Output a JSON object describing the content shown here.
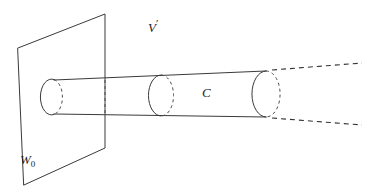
{
  "figure": {
    "kind": "geometric-diagram",
    "caption_labels": {
      "ambient_space": "V",
      "ambient_space_modifier": "′",
      "plane": "W",
      "plane_subscript": "0",
      "cylinder": "C"
    },
    "colors": {
      "background": "#ffffff",
      "visible_stroke": "#3a3a3a",
      "hidden_stroke": "#4a4a4a",
      "extension_stroke": "#333333",
      "text": "#1e1e1e"
    },
    "canvas": {
      "width": 369,
      "height": 195
    },
    "geometry": {
      "plane_polygon": "18,48 105,14 105,148 24,185",
      "plane_edge_through_cylinder_top": "M 105 76 L 105 79",
      "plane_hidden_segment": "M 105 80 L 105 113",
      "cylinder_top_edge": "M 54 80 L 266 71",
      "cylinder_bottom_edge": "M 54 114 L 266 117",
      "cap_left_front_arc": "M 54 79.5 A 11 18 0 1 0 54 114.5",
      "cap_left_back_arc": "M 54 79.5 A 11 18 0 0 1 54 114.5",
      "cap_mid_front_arc": "M 161 75 A 11 18 0 1 0 161 116",
      "cap_mid_back_arc": "M 161 75 A 11 18 0 0 1 161 116",
      "cap_right_front_arc": "M 266 71 A 11 18 0 1 0 266 117",
      "cap_right_back_arc": "M 266 71 A 11 18 0 0 1 266 117",
      "extension_top": "M 272 70 L 362 63",
      "extension_bottom": "M 272 118 L 362 125"
    }
  }
}
